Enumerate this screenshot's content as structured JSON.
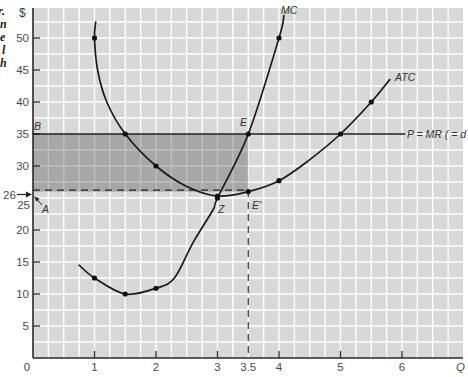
{
  "chart_data": {
    "type": "line",
    "title": "",
    "xlabel": "Q",
    "ylabel": "$",
    "xlim": [
      0,
      6.5
    ],
    "ylim": [
      0,
      54
    ],
    "grid": true,
    "x_ticks": [
      {
        "value": 0,
        "label": "0"
      },
      {
        "value": 1,
        "label": "1"
      },
      {
        "value": 2,
        "label": "2"
      },
      {
        "value": 3,
        "label": "3"
      },
      {
        "value": 3.5,
        "label": "3.5"
      },
      {
        "value": 4,
        "label": "4"
      },
      {
        "value": 5,
        "label": "5"
      },
      {
        "value": 6,
        "label": "6"
      }
    ],
    "y_ticks": [
      {
        "value": 5,
        "label": "5"
      },
      {
        "value": 10,
        "label": "10"
      },
      {
        "value": 15,
        "label": "15"
      },
      {
        "value": 20,
        "label": "20"
      },
      {
        "value": 25,
        "label": "25"
      },
      {
        "value": 26,
        "label": "26"
      },
      {
        "value": 30,
        "label": "30"
      },
      {
        "value": 35,
        "label": "35"
      },
      {
        "value": 40,
        "label": "40"
      },
      {
        "value": 45,
        "label": "45"
      },
      {
        "value": 50,
        "label": "50"
      }
    ],
    "series": [
      {
        "name": "MC",
        "points": [
          [
            0.75,
            14.5
          ],
          [
            1,
            12.5
          ],
          [
            1.5,
            10
          ],
          [
            2,
            10.9
          ],
          [
            2.3,
            12.5
          ],
          [
            2.6,
            18
          ],
          [
            2.93,
            23.2
          ],
          [
            3,
            25
          ],
          [
            3.5,
            35
          ],
          [
            4,
            50
          ],
          [
            4.08,
            53.5
          ]
        ],
        "markers": [
          [
            1,
            12.5
          ],
          [
            1.5,
            10
          ],
          [
            2,
            10.9
          ],
          [
            3,
            25
          ],
          [
            3.5,
            35
          ],
          [
            4,
            50
          ]
        ]
      },
      {
        "name": "ATC",
        "points": [
          [
            1.02,
            52.5
          ],
          [
            1.0,
            50
          ],
          [
            1.05,
            45
          ],
          [
            1.2,
            40
          ],
          [
            1.5,
            35
          ],
          [
            2,
            30
          ],
          [
            2.5,
            26.8
          ],
          [
            3,
            25.3
          ],
          [
            3.5,
            26
          ],
          [
            4,
            27.7
          ],
          [
            4.5,
            31
          ],
          [
            5,
            35
          ],
          [
            5.5,
            40
          ],
          [
            5.8,
            43.5
          ]
        ],
        "markers": [
          [
            1,
            50
          ],
          [
            1.5,
            35
          ],
          [
            2,
            30
          ],
          [
            3,
            25.3
          ],
          [
            3.5,
            26
          ],
          [
            4,
            27.7
          ],
          [
            5,
            35
          ],
          [
            5.5,
            40
          ]
        ]
      },
      {
        "name": "P = MR ( = d",
        "points": [
          [
            0,
            35
          ],
          [
            6.05,
            35
          ]
        ],
        "markers": []
      }
    ],
    "shaded_region": {
      "x": [
        0,
        3.5
      ],
      "y": [
        26,
        35
      ],
      "meaning": "profit area B-E-E'-A"
    },
    "reference_lines": [
      {
        "type": "horizontal-dashed",
        "y": 26,
        "x_from": 0,
        "x_to": 3.5
      },
      {
        "type": "vertical-dashed",
        "x": 3.5,
        "y_from": 0,
        "y_to": 26
      }
    ],
    "annotations": [
      {
        "label": "B",
        "x": 0,
        "y": 35
      },
      {
        "label": "A",
        "x": 0,
        "y": 26
      },
      {
        "label": "E",
        "x": 3.5,
        "y": 35
      },
      {
        "label": "Z",
        "x": 3,
        "y": 25.3
      },
      {
        "label": "E'",
        "x": 3.5,
        "y": 26
      }
    ]
  },
  "labels": {
    "y_unit": "$",
    "x_axis": "Q",
    "origin": "0",
    "mc": "MC",
    "atc": "ATC",
    "price_line": "P = MR ( = d",
    "point_b": "B",
    "point_a": "A",
    "point_e": "E",
    "point_z": "Z",
    "point_e_prime": "E'",
    "price_26": "26",
    "tick_25": "25"
  },
  "left_caption_fragments": [
    "r.",
    "n",
    "e",
    "l",
    "h"
  ],
  "colors": {
    "plot_background": "#d8d8d8",
    "grid": "#ffffff",
    "shaded": "#606060",
    "curve": "#1a1a1a",
    "axis": "#2a2a2a"
  }
}
